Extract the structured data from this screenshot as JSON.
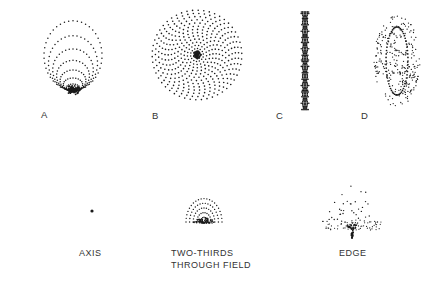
{
  "panels_top": [
    {
      "id": "A",
      "label": "A"
    },
    {
      "id": "B",
      "label": "B"
    },
    {
      "id": "C",
      "label": "C"
    },
    {
      "id": "D",
      "label": "D"
    }
  ],
  "panels_bottom": [
    {
      "id": "axis",
      "label": "AXIS"
    },
    {
      "id": "two-thirds",
      "label_line1": "TWO-THIRDS",
      "label_line2": "THROUGH FIELD"
    },
    {
      "id": "edge",
      "label": "EDGE"
    }
  ],
  "colors": {
    "dots": "#1a1a1a",
    "background": "#ffffff"
  }
}
